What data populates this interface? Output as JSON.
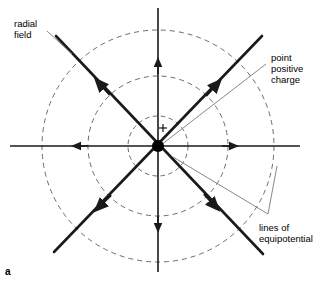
{
  "figure": {
    "panel_letter": "a",
    "charge_symbol": "+",
    "labels": {
      "radial_field": "radial\nfield",
      "point_positive_charge": "point\npositive\ncharge",
      "lines_of_equipotential": "lines of\nequipotential"
    },
    "colors": {
      "field_line": "#1a1a1a",
      "equipotential_line": "#6b6b6b",
      "leader_line": "#7a7a7a",
      "charge_dot": "#000000",
      "background": "#ffffff",
      "text": "#000000"
    }
  },
  "diagram_data": {
    "type": "vector-field-diagram",
    "description": "Radial electric field of a point positive charge with circular equipotential lines",
    "center": {
      "x": 158,
      "y": 146
    },
    "charge": {
      "sign": "+",
      "symbol_position": {
        "x": 163,
        "y": 124
      },
      "dot_radius": 6
    },
    "field_lines": [
      {
        "name": "east",
        "angle_deg": 0,
        "start": {
          "x": 158,
          "y": 146
        },
        "end": {
          "x": 300,
          "y": 146
        },
        "arrow_at": {
          "x": 232,
          "y": 146
        },
        "direction": "outward"
      },
      {
        "name": "west",
        "angle_deg": 180,
        "start": {
          "x": 158,
          "y": 146
        },
        "end": {
          "x": 10,
          "y": 146
        },
        "arrow_at": {
          "x": 78,
          "y": 146
        },
        "direction": "outward"
      },
      {
        "name": "north",
        "angle_deg": 90,
        "start": {
          "x": 158,
          "y": 146
        },
        "end": {
          "x": 158,
          "y": 8
        },
        "arrow_at": {
          "x": 158,
          "y": 62
        },
        "direction": "outward"
      },
      {
        "name": "south",
        "angle_deg": 270,
        "start": {
          "x": 158,
          "y": 146
        },
        "end": {
          "x": 158,
          "y": 272
        },
        "arrow_at": {
          "x": 158,
          "y": 228
        },
        "direction": "outward"
      },
      {
        "name": "northeast",
        "angle_deg": 45,
        "start": {
          "x": 158,
          "y": 146
        },
        "end": {
          "x": 262,
          "y": 36
        },
        "arrow_at": {
          "x": 216,
          "y": 85
        },
        "direction": "outward"
      },
      {
        "name": "northwest",
        "angle_deg": 135,
        "start": {
          "x": 158,
          "y": 146
        },
        "end": {
          "x": 56,
          "y": 36
        },
        "arrow_at": {
          "x": 100,
          "y": 84
        },
        "direction": "outward"
      },
      {
        "name": "southeast",
        "angle_deg": 315,
        "start": {
          "x": 158,
          "y": 146
        },
        "end": {
          "x": 263,
          "y": 254
        },
        "arrow_at": {
          "x": 214,
          "y": 204
        },
        "direction": "outward"
      },
      {
        "name": "southwest",
        "angle_deg": 225,
        "start": {
          "x": 158,
          "y": 146
        },
        "end": {
          "x": 54,
          "y": 252
        },
        "arrow_at": {
          "x": 100,
          "y": 205
        },
        "direction": "outward"
      }
    ],
    "equipotential_circles": [
      {
        "index": 1,
        "radius": 30,
        "style": "dashed"
      },
      {
        "index": 2,
        "radius": 70,
        "style": "dashed"
      },
      {
        "index": 3,
        "radius": 116,
        "style": "dashed"
      }
    ],
    "leader_lines": [
      {
        "target": "point_positive_charge",
        "from": {
          "x": 266,
          "y": 64
        },
        "to": {
          "x": 160,
          "y": 146
        }
      },
      {
        "target": "lines_of_equipotential",
        "from": {
          "x": 268,
          "y": 214
        },
        "to": {
          "x": 173,
          "y": 157
        }
      },
      {
        "target": "lines_of_equipotential",
        "from": {
          "x": 268,
          "y": 214
        },
        "to": {
          "x": 276,
          "y": 166
        }
      },
      {
        "target": "radial_field",
        "from": {
          "x": 45,
          "y": 30
        },
        "to": {
          "x": 70,
          "y": 52
        }
      }
    ]
  }
}
